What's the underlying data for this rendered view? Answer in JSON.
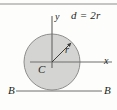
{
  "figure": {
    "kind": "geometry-diagram",
    "background_color": "#fdfdfc",
    "circle": {
      "center_x": 52,
      "center_y": 62,
      "radius": 28,
      "fill_color": "#d4d4d2",
      "stroke_color": "#8d8d8b",
      "stroke_width": 1
    },
    "axes": {
      "line_color": "#6e6e6c",
      "y_axis": {
        "x": 52,
        "y_top": 16,
        "y_bottom": 68
      },
      "x_axis": {
        "y": 62,
        "x_left": 30,
        "x_right": 112
      }
    },
    "radius_arrow": {
      "from_x": 52,
      "from_y": 62,
      "to_x": 72,
      "to_y": 42,
      "color": "#4a4a48"
    },
    "section_line": {
      "y": 91,
      "x_left": 16,
      "x_right": 102,
      "color": "#6e6e6c"
    },
    "top_rule": {
      "y": 4,
      "x_left": 0,
      "x_right": 117,
      "color": "#8d8d8b"
    },
    "labels": {
      "y_axis": "y",
      "x_axis": "x",
      "center": "C",
      "radius": "r",
      "diameter_equation": "d = 2r",
      "section_left": "B",
      "section_right": "B"
    }
  }
}
